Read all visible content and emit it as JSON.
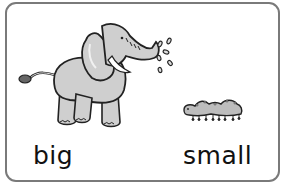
{
  "card": {
    "left_picture": "elephant",
    "right_picture": "caterpillar",
    "labels": {
      "big": "big",
      "small": "small"
    }
  },
  "colors": {
    "border": "#7a7a7a",
    "fill": "#cfcfcf",
    "outline": "#222222",
    "text": "#111111"
  }
}
